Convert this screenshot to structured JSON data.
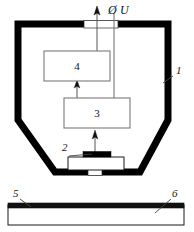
{
  "figure": {
    "signal_label": "Ø U",
    "phi_symbol": "Ø",
    "voltage_symbol": "U"
  },
  "callouts": [
    {
      "id": "1",
      "label": "1",
      "target": "outer-shield-housing",
      "x": 176,
      "y": 73
    },
    {
      "id": "2",
      "label": "2",
      "target": "detector-sensor-element",
      "x": 66,
      "y": 152
    },
    {
      "id": "5",
      "label": "5",
      "target": "substrate-top-layer",
      "x": 16,
      "y": 196
    },
    {
      "id": "6",
      "label": "6",
      "target": "substrate-body",
      "x": 172,
      "y": 196
    }
  ],
  "blocks": [
    {
      "id": "4",
      "label": "4",
      "name": "upper-processing-block",
      "x": 44,
      "y": 51,
      "w": 66,
      "h": 30
    },
    {
      "id": "3",
      "label": "3",
      "name": "lower-processing-block",
      "x": 64,
      "y": 98,
      "w": 66,
      "h": 30
    }
  ],
  "components": {
    "housing": {
      "name": "shield-housing",
      "stroke_color": "#000000"
    },
    "top_window": {
      "name": "top-window-aperture",
      "fill": "#ffffff"
    },
    "bottom_window": {
      "name": "bottom-window-aperture",
      "fill": "#ffffff"
    },
    "detector_body": {
      "name": "detector-body",
      "fill": "#ffffff"
    },
    "detector_strip": {
      "name": "detector-active-strip",
      "fill": "#000000"
    },
    "substrate_layer": {
      "name": "substrate-top-layer",
      "fill": "#111111"
    },
    "substrate_body": {
      "name": "substrate-body",
      "fill": "#ffffff"
    }
  },
  "colors": {
    "ink": "#000000",
    "line": "#6b6b6b",
    "paper": "#ffffff"
  }
}
